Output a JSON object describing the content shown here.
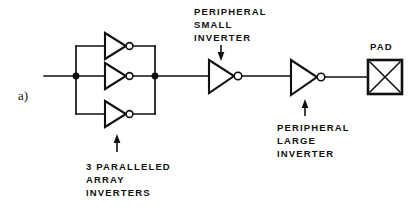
{
  "figure": {
    "panel_label": "a)",
    "background": "#ffffff",
    "ink_color": "#111111"
  },
  "labels": {
    "array_inverters": {
      "lines": [
        "3 PARALLELED",
        "ARRAY",
        "INVERTERS"
      ],
      "line1": "3 PARALLELED",
      "line2": "ARRAY",
      "line3": "INVERTERS"
    },
    "peripheral_small": {
      "lines": [
        "PERIPHERAL",
        "SMALL",
        "INVERTER"
      ],
      "line1": "PERIPHERAL",
      "line2": "SMALL",
      "line3": "INVERTER"
    },
    "peripheral_large": {
      "lines": [
        "PERIPHERAL",
        "LARGE",
        "INVERTER"
      ],
      "line1": "PERIPHERAL",
      "line2": "LARGE",
      "line3": "INVERTER"
    },
    "pad": "PAD"
  },
  "circuit": {
    "description": "Inverter chain driving an output pad",
    "stages": [
      {
        "name": "array-inverters",
        "type": "inverter",
        "count": 3,
        "arrangement": "parallel"
      },
      {
        "name": "peripheral-small-inverter",
        "type": "inverter",
        "count": 1,
        "size": "small"
      },
      {
        "name": "peripheral-large-inverter",
        "type": "inverter",
        "count": 1,
        "size": "large"
      },
      {
        "name": "output-pad",
        "type": "pad",
        "symbol": "square-with-x"
      }
    ],
    "junction_count": 2
  }
}
